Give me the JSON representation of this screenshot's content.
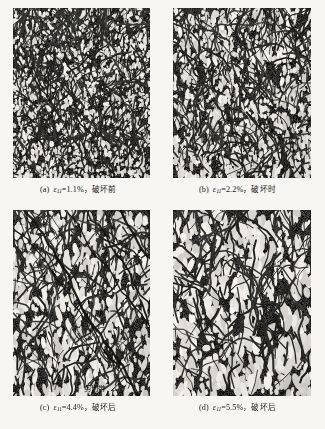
{
  "figure": {
    "background_color": "#f7f6f3",
    "ink_color": "#1b1b1b",
    "panel_count": 4
  },
  "panels": [
    {
      "id": "a",
      "tag": "(a)",
      "symbol": "ε",
      "subscript": "11",
      "equals": "=",
      "strain_value": "1.1%",
      "separator": "，",
      "state_label": "破坏前",
      "caption_text": "(a)  ε11=1.1%，破坏前",
      "texture": {
        "description": "dense fine speckle microstructure, pre-failure",
        "void_count": 2300,
        "void_scale": 1.0,
        "void_elongation": 1.35,
        "band_count": 0,
        "dark_fraction": 0.62
      }
    },
    {
      "id": "b",
      "tag": "(b)",
      "symbol": "ε",
      "subscript": "11",
      "equals": "=",
      "strain_value": "2.2%",
      "separator": "，",
      "state_label": "破坏时",
      "caption_text": "(b)  ε11=2.2%，破坏时",
      "texture": {
        "description": "elongated vertical voids forming, at failure",
        "void_count": 1700,
        "void_scale": 1.25,
        "void_elongation": 1.9,
        "band_count": 0,
        "dark_fraction": 0.58
      }
    },
    {
      "id": "c",
      "tag": "(c)",
      "symbol": "ε",
      "subscript": "11",
      "equals": "=",
      "strain_value": "4.4%",
      "separator": "，",
      "state_label": "破坏后",
      "caption_text": "(c)  ε11=4.4%，破坏后",
      "texture": {
        "description": "coarse network with prominent inclined shear bands, post-failure",
        "void_count": 950,
        "void_scale": 1.75,
        "void_elongation": 2.3,
        "band_count": 7,
        "dark_fraction": 0.5
      }
    },
    {
      "id": "d",
      "tag": "(d)",
      "symbol": "ε",
      "subscript": "11",
      "equals": "=",
      "strain_value": "5.5%",
      "separator": "，",
      "state_label": "破坏后",
      "caption_text": "(d)  ε11=5.5%，破坏后",
      "texture": {
        "description": "coarsest open cellular network, post-failure",
        "void_count": 700,
        "void_scale": 2.2,
        "void_elongation": 2.1,
        "band_count": 0,
        "dark_fraction": 0.46
      }
    }
  ],
  "annotations": [
    {
      "id": "shear-band",
      "label": "剪切带",
      "panel": "c",
      "leader": "line pointing up-right into panel c"
    }
  ]
}
